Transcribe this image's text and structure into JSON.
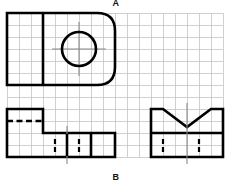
{
  "figure": {
    "kind": "orthographic-projection-drawing",
    "background_color": "#ffffff",
    "grid": {
      "color": "#bfbfbf",
      "pitch_px": 12,
      "x_start": 7,
      "y_start": 13,
      "cols": 18,
      "rows": 12,
      "visible": true
    },
    "line_colors": {
      "object_line": "#000000",
      "hidden_line": "#000000",
      "center_line": "#8a8a8a",
      "grid_line": "#c4c4c4"
    },
    "labels": {
      "top": "A",
      "bottom": "B"
    },
    "views": {
      "top_view": {
        "name": "top-view",
        "x": 7,
        "y": 13,
        "w": 108,
        "h": 72,
        "corner_radius": 18,
        "rounded_side": "right",
        "divider_x": 43,
        "circle": {
          "cx": 79,
          "cy": 49,
          "r": 17
        },
        "center_lines": true
      },
      "front_view": {
        "name": "front-view",
        "x": 7,
        "y": 109,
        "w": 108,
        "h": 48,
        "step_x": 43,
        "step_y": 133,
        "hidden_line_y": 121,
        "hidden_line_x1": 7,
        "hidden_line_x2": 43,
        "hidden_verticals": [
          67,
          91
        ],
        "solid_verticals": [
          67,
          91
        ],
        "center_tick_x": 67
      },
      "right_view": {
        "name": "right-side-view",
        "x": 151,
        "y": 109,
        "w": 72,
        "h": 48,
        "notch_left_x": 163,
        "notch_right_x": 211,
        "notch_bottom_y": 127,
        "notch_apex_x": 187,
        "divider_y": 133,
        "hidden_verticals": [
          163,
          199
        ],
        "center_line_x": 187
      }
    }
  }
}
